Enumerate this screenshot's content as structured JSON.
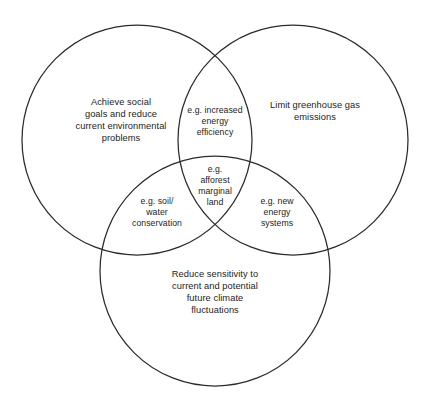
{
  "diagram": {
    "type": "venn",
    "set_count": 3,
    "background_color": "#ffffff",
    "stroke_color": "#2b2b2b",
    "text_color": "#1d1d1d",
    "sets": [
      {
        "id": "social-environmental",
        "position": "top-left",
        "label": "Achieve social\ngoals and reduce\ncurrent environmental\nproblems",
        "center": {
          "x": 137,
          "y": 140
        },
        "radius": 115
      },
      {
        "id": "greenhouse-gas",
        "position": "top-right",
        "label": "Limit greenhouse gas\nemissions",
        "center": {
          "x": 293,
          "y": 140
        },
        "radius": 115
      },
      {
        "id": "climate-sensitivity",
        "position": "bottom",
        "label": "Reduce sensitivity to\ncurrent and potential\nfuture climate\nfluctuations",
        "center": {
          "x": 215,
          "y": 271
        },
        "radius": 115
      }
    ],
    "intersections": [
      {
        "id": "top-lens",
        "sets": [
          "social-environmental",
          "greenhouse-gas"
        ],
        "label": "e.g. increased\nenergy\nefficiency"
      },
      {
        "id": "center",
        "sets": [
          "social-environmental",
          "greenhouse-gas",
          "climate-sensitivity"
        ],
        "label": "e.g.\nafforest\nmarginal\nland"
      },
      {
        "id": "left-lens",
        "sets": [
          "social-environmental",
          "climate-sensitivity"
        ],
        "label": "e.g. soil/\nwater\nconservation"
      },
      {
        "id": "right-lens",
        "sets": [
          "greenhouse-gas",
          "climate-sensitivity"
        ],
        "label": "e.g. new\nenergy\nsystems"
      }
    ]
  }
}
